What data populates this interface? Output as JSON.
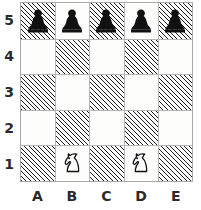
{
  "diagram": {
    "type": "chess-board-diagram",
    "board_size": {
      "files": 5,
      "ranks": 5
    },
    "file_labels": [
      "A",
      "B",
      "C",
      "D",
      "E"
    ],
    "rank_labels": [
      "5",
      "4",
      "3",
      "2",
      "1"
    ],
    "colors": {
      "light_square": "#fdfdfb",
      "dark_square_hatch": "#1c1c1c",
      "border": "#a8a8a8",
      "grid_line": "#b5b5b5",
      "black_piece": "#111111",
      "white_piece_outline": "#111111",
      "white_piece_fill": "#ffffff",
      "label_text": "#2a2a2a"
    },
    "square_shading": [
      [
        "dark",
        "light",
        "dark",
        "light",
        "dark"
      ],
      [
        "light",
        "dark",
        "light",
        "dark",
        "light"
      ],
      [
        "dark",
        "light",
        "dark",
        "light",
        "dark"
      ],
      [
        "light",
        "dark",
        "light",
        "dark",
        "light"
      ],
      [
        "dark",
        "light",
        "dark",
        "light",
        "dark"
      ]
    ],
    "pieces": [
      {
        "square": "A5",
        "file": 0,
        "rank_row": 0,
        "color": "black",
        "type": "pawn",
        "icon": "black-pawn-icon"
      },
      {
        "square": "B5",
        "file": 1,
        "rank_row": 0,
        "color": "black",
        "type": "pawn",
        "icon": "black-pawn-icon"
      },
      {
        "square": "C5",
        "file": 2,
        "rank_row": 0,
        "color": "black",
        "type": "pawn",
        "icon": "black-pawn-icon"
      },
      {
        "square": "D5",
        "file": 3,
        "rank_row": 0,
        "color": "black",
        "type": "pawn",
        "icon": "black-pawn-icon"
      },
      {
        "square": "E5",
        "file": 4,
        "rank_row": 0,
        "color": "black",
        "type": "pawn",
        "icon": "black-pawn-icon"
      },
      {
        "square": "B1",
        "file": 1,
        "rank_row": 4,
        "color": "white",
        "type": "knight",
        "icon": "white-knight-icon"
      },
      {
        "square": "D1",
        "file": 3,
        "rank_row": 4,
        "color": "white",
        "type": "knight",
        "icon": "white-knight-icon"
      }
    ]
  }
}
